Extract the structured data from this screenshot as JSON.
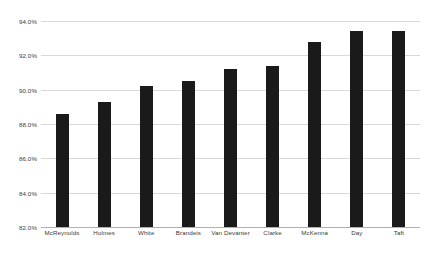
{
  "chart_data": {
    "type": "bar",
    "title": "",
    "subtitle": "",
    "xlabel": "",
    "ylabel": "",
    "categories": [
      "McReynolds",
      "Holmes",
      "White",
      "Brandeis",
      "Van Devanter",
      "Clarke",
      "McKenna",
      "Day",
      "Taft"
    ],
    "values": [
      88.6,
      89.3,
      90.2,
      90.5,
      91.2,
      91.4,
      92.8,
      93.4,
      93.4
    ],
    "ylim": [
      82.0,
      94.0
    ],
    "y_ticks": [
      82.0,
      84.0,
      86.0,
      88.0,
      90.0,
      92.0,
      94.0
    ],
    "y_tick_labels": [
      "82.0%",
      "84.0%",
      "86.0%",
      "88.0%",
      "90.0%",
      "92.0%",
      "94.0%"
    ],
    "grid": true,
    "legend": null,
    "legend_position": "none",
    "series": [
      {
        "name": "",
        "values": [
          88.6,
          89.3,
          90.2,
          90.5,
          91.2,
          91.4,
          92.8,
          93.4,
          93.4
        ]
      }
    ],
    "colors": {
      "bar": "#1a1a1a",
      "gridline": "#d9d9d9",
      "axis": "#b0b0b0",
      "text": "#3b3b3b",
      "background": "#ffffff"
    }
  }
}
